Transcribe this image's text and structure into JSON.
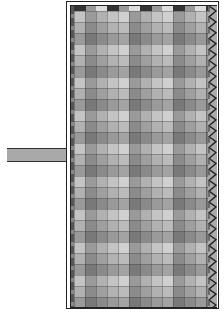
{
  "figure": {
    "colors": {
      "background": "#ffffff",
      "border": "#222222",
      "handle": "#a9a9a9",
      "fabric_base": "#f2f2f2",
      "stripe_light": "#e6e6e6",
      "stripe_mid": "#cfcfcf",
      "stripe_dark": "#b4b4b4"
    },
    "pattern": {
      "column_width_px": 11,
      "row_height_px": 11,
      "column_tones": [
        "light",
        "dark",
        "mid",
        "light",
        "lighter",
        "dark",
        "mid",
        "light",
        "lighter",
        "dark",
        "mid",
        "light",
        "dark"
      ],
      "row_tones": [
        "light",
        "mid",
        "dark",
        "light",
        "mid",
        "dark",
        "light",
        "mid",
        "dark",
        "light",
        "mid",
        "dark",
        "light",
        "mid",
        "dark",
        "light",
        "mid",
        "dark",
        "light",
        "mid",
        "dark",
        "light",
        "mid",
        "dark",
        "light",
        "mid",
        "dark",
        "light"
      ]
    },
    "edge_right": "zigzag-stitch",
    "edge_left": "double-border"
  }
}
